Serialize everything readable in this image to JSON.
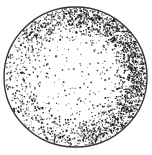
{
  "figure": {
    "type": "stipple-disk",
    "caption_fragment": "",
    "disk": {
      "cx": 75.5,
      "cy": 77,
      "rx": 71.5,
      "ry": 70,
      "stroke": "#333333",
      "stroke_width": 1.4,
      "fill": "#ffffff"
    },
    "stipple": {
      "color": "#111111",
      "dot_count": 2600,
      "seed": 7,
      "dense_region": {
        "description": "crescent along upper and right rim",
        "angle_deg": 15,
        "spread_deg": 80,
        "peak_radius_frac": 0.86
      },
      "sparse_region": {
        "description": "center and lower-left interior",
        "base_density": 0.08
      }
    }
  }
}
